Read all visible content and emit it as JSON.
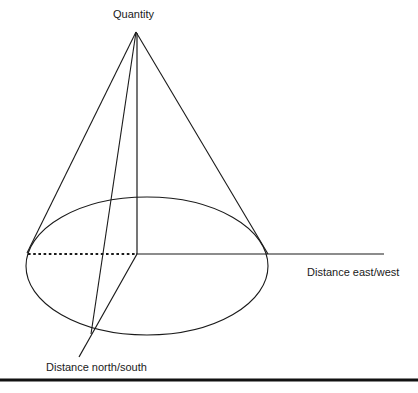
{
  "figure": {
    "type": "3d-cone-axes-diagram",
    "title": "",
    "background_color": "#ffffff",
    "line_color": "#1a1a1a",
    "labels": {
      "vertical_axis": "Quantity",
      "horizontal_axis": "Distance east/west",
      "depth_axis": "Distance north/south"
    },
    "geometry": {
      "apex": {
        "x": 136,
        "y": 32
      },
      "origin": {
        "x": 137,
        "y": 254
      },
      "base_ellipse": {
        "cx": 147,
        "cy": 266,
        "rx": 121,
        "ry": 69
      },
      "east_west_axis": {
        "dotted_from": {
          "x": 28,
          "y": 254
        },
        "solid_from": {
          "x": 137,
          "y": 254
        },
        "to": {
          "x": 384,
          "y": 254
        }
      },
      "north_south_axis": {
        "from": {
          "x": 137,
          "y": 254
        },
        "to": {
          "x": 79,
          "y": 357
        }
      },
      "cone_edges": [
        {
          "from": {
            "x": 136,
            "y": 32
          },
          "to": {
            "x": 27,
            "y": 253
          }
        },
        {
          "from": {
            "x": 136,
            "y": 32
          },
          "to": {
            "x": 268,
            "y": 254
          }
        },
        {
          "from": {
            "x": 136,
            "y": 32
          },
          "to": {
            "x": 91,
            "y": 334
          }
        }
      ],
      "vertical_axis_segment": {
        "from": {
          "x": 137,
          "y": 32
        },
        "to": {
          "x": 137,
          "y": 254
        }
      },
      "bottom_rule": {
        "y": 380,
        "x1": 0,
        "x2": 418,
        "thickness": 3
      }
    }
  }
}
